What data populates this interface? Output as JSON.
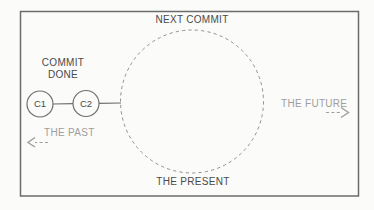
{
  "diagram": {
    "top_label": "NEXT COMMIT",
    "commit_done": {
      "line1": "COMMIT",
      "line2": "DONE"
    },
    "nodes": [
      {
        "id": "c1",
        "label": "C1"
      },
      {
        "id": "c2",
        "label": "C2"
      }
    ],
    "past_label": "THE PAST",
    "future_label": "THE FUTURE",
    "bottom_label": "THE PRESENT"
  },
  "colors": {
    "background": "#fbfbf9",
    "frame_stroke": "#6b6b6b",
    "dark_text": "#4a4a4a",
    "light_text": "#9e9e9e",
    "node_stroke": "#6f6f6f",
    "dashed_circle_stroke": "#8f8f8f",
    "arrow_stroke": "#9e9e9e"
  }
}
